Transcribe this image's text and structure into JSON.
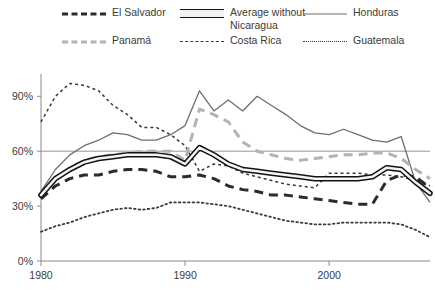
{
  "legend": {
    "items": [
      {
        "key": "el_salvador",
        "label": "El Salvador",
        "style": "thick-dashed",
        "color": "#2b2b2b",
        "col": 0,
        "row": 0
      },
      {
        "key": "average_without_nicaragua",
        "label": "Average without Nicaragua",
        "style": "thick-band",
        "color": "#121212",
        "col": 1,
        "row": 0
      },
      {
        "key": "honduras",
        "label": "Honduras",
        "style": "thin-solid",
        "color": "#6e6e6e",
        "col": 2,
        "row": 0
      },
      {
        "key": "panama",
        "label": "Panamá",
        "style": "thick-dashed",
        "color": "#b3b3b3",
        "col": 0,
        "row": 1
      },
      {
        "key": "costa_rica",
        "label": "Costa Rica",
        "style": "thin-dashed",
        "color": "#3a3a3a",
        "col": 1,
        "row": 1
      },
      {
        "key": "guatemala",
        "label": "Guatemala",
        "style": "dotted",
        "color": "#3a3a3a",
        "col": 2,
        "row": 1
      }
    ]
  },
  "chart_data": {
    "type": "line",
    "title": "",
    "subtitle": "",
    "xlabel": "",
    "ylabel": "",
    "xlim": [
      1980,
      2007
    ],
    "ylim": [
      0,
      100
    ],
    "grid": "single-horizontal-at-60",
    "legend_position": "top",
    "y_ticks": [
      0,
      30,
      60,
      90
    ],
    "y_tick_labels": [
      "0%",
      "30%",
      "60%",
      "90%"
    ],
    "x_ticks": [
      1980,
      1990,
      2000
    ],
    "x_tick_labels": [
      "1980",
      "1990",
      "2000"
    ],
    "gridline_values": [
      60
    ],
    "x": [
      1980,
      1981,
      1982,
      1983,
      1984,
      1985,
      1986,
      1987,
      1988,
      1989,
      1990,
      1991,
      1992,
      1993,
      1994,
      1995,
      1996,
      1997,
      1998,
      1999,
      2000,
      2001,
      2002,
      2003,
      2004,
      2005,
      2006,
      2007
    ],
    "series": [
      {
        "name": "El Salvador",
        "style": "thick-dashed",
        "color": "#2b2b2b",
        "width": 3.0,
        "dash": "9 6",
        "values": [
          34,
          41,
          45,
          47,
          47,
          49,
          50,
          50,
          49,
          46,
          46,
          47,
          45,
          41,
          39,
          38,
          36,
          36,
          35,
          34,
          33,
          32,
          31,
          31,
          44,
          47,
          46,
          40
        ]
      },
      {
        "name": "Average without Nicaragua",
        "style": "thick-band",
        "color": "#121212",
        "width": 5.5,
        "dash": "none",
        "values": [
          36,
          45,
          50,
          54,
          56,
          57,
          58,
          58,
          58,
          57,
          53,
          62,
          58,
          53,
          50,
          49,
          48,
          47,
          46,
          45,
          45,
          45,
          45,
          46,
          51,
          50,
          43,
          37
        ]
      },
      {
        "name": "Honduras",
        "style": "thin-solid",
        "color": "#6e6e6e",
        "width": 1.3,
        "dash": "none",
        "values": [
          38,
          50,
          58,
          63,
          66,
          70,
          69,
          66,
          66,
          69,
          74,
          93,
          82,
          88,
          82,
          90,
          85,
          80,
          74,
          70,
          69,
          72,
          69,
          66,
          65,
          68,
          43,
          32
        ]
      },
      {
        "name": "Panamá",
        "style": "thick-dashed",
        "color": "#b3b3b3",
        "width": 3.0,
        "dash": "9 6",
        "values": [
          36,
          45,
          51,
          55,
          57,
          58,
          59,
          60,
          60,
          60,
          55,
          83,
          80,
          76,
          65,
          60,
          58,
          56,
          55,
          56,
          57,
          58,
          58,
          59,
          59,
          56,
          50,
          45
        ]
      },
      {
        "name": "Costa Rica",
        "style": "thin-dashed",
        "color": "#3a3a3a",
        "width": 1.5,
        "dash": "3 3",
        "values": [
          76,
          90,
          97,
          96,
          93,
          85,
          80,
          73,
          73,
          69,
          63,
          49,
          53,
          52,
          48,
          46,
          44,
          42,
          41,
          40,
          48,
          48,
          48,
          47,
          47,
          46,
          44,
          41
        ]
      },
      {
        "name": "Guatemala",
        "style": "dotted",
        "color": "#3a3a3a",
        "width": 1.8,
        "dash": "1.6 3",
        "values": [
          16,
          19,
          21,
          24,
          26,
          28,
          29,
          28,
          29,
          32,
          32,
          32,
          31,
          30,
          28,
          26,
          24,
          22,
          21,
          20,
          20,
          21,
          21,
          21,
          21,
          20,
          17,
          13
        ]
      }
    ]
  }
}
